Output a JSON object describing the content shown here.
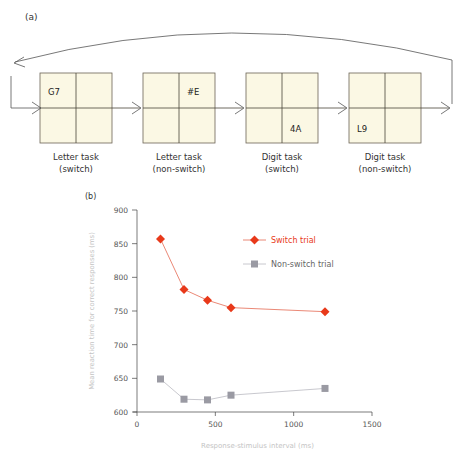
{
  "panel_a": {
    "label": "(a)",
    "boxes": [
      {
        "text": "G7",
        "quadrant": "top-left",
        "caption1": "Letter task",
        "caption2": "(switch)"
      },
      {
        "text": "#E",
        "quadrant": "top-right",
        "caption1": "Letter task",
        "caption2": "(non-switch)"
      },
      {
        "text": "4A",
        "quadrant": "bottom-right",
        "caption1": "Digit task",
        "caption2": "(switch)"
      },
      {
        "text": "L9",
        "quadrant": "bottom-left",
        "caption1": "Digit task",
        "caption2": "(non-switch)"
      }
    ],
    "box_color": "#fbf8e4"
  },
  "panel_b": {
    "label": "(b)"
  },
  "chart_data": {
    "type": "line",
    "title": "",
    "xlabel": "Response-stimulus interval (ms)",
    "ylabel": "Mean reaction time for correct responses (ms)",
    "xlim": [
      0,
      1500
    ],
    "ylim": [
      600,
      900
    ],
    "xticks": [
      0,
      500,
      1000,
      1500
    ],
    "yticks": [
      600,
      650,
      700,
      750,
      800,
      850,
      900
    ],
    "grid": false,
    "legend_position": "upper right",
    "x": [
      150,
      300,
      450,
      600,
      1200
    ],
    "series": [
      {
        "name": "Switch trial",
        "marker": "diamond",
        "color": "#e8391a",
        "values": [
          857,
          782,
          766,
          755,
          749
        ]
      },
      {
        "name": "Non-switch trial",
        "marker": "square",
        "color": "#9a9aa3",
        "values": [
          649,
          619,
          618,
          625,
          635
        ]
      }
    ]
  }
}
